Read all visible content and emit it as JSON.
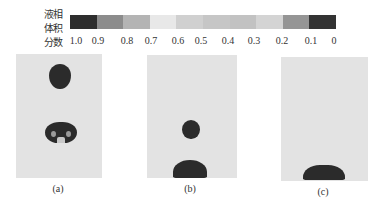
{
  "colorbar": {
    "title_lines": [
      "液相",
      "体积",
      "分数"
    ],
    "ticks": [
      "1.0",
      "0.9",
      "0.8",
      "0.7",
      "0.6",
      "0.5",
      "0.4",
      "0.3",
      "0.2",
      "0.1",
      "0"
    ],
    "tick_x": [
      76,
      98,
      127,
      151,
      178,
      201,
      228,
      254,
      282,
      311,
      334
    ],
    "segment_colors": [
      "#2e2e2e",
      "#8c8c8c",
      "#b4b4b4",
      "#e8e8e8",
      "#d0d0d0",
      "#c6c6c6",
      "#c2c2c2",
      "#d4d4d4",
      "#959595",
      "#333333"
    ]
  },
  "panels": [
    {
      "id": "a",
      "caption": "(a)"
    },
    {
      "id": "b",
      "caption": "(b)"
    },
    {
      "id": "c",
      "caption": "(c)"
    }
  ],
  "colors": {
    "panel_background": "#e3e3e3",
    "liquid": "#2b2b2b"
  }
}
